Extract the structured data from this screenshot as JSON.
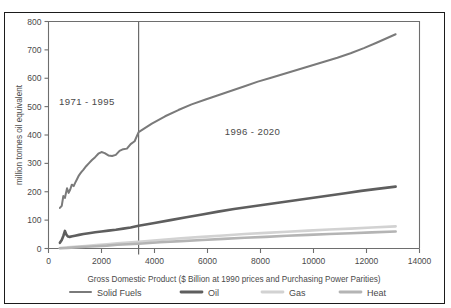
{
  "figure": {
    "cut_off_title": "",
    "background_color": "#ffffff",
    "frame_color": "#1b1b1b"
  },
  "chart_data": {
    "type": "line",
    "title": "",
    "xlabel": "Gross Domestic Product ($ Billion at 1990 prices and Purchasing Power Parities)",
    "ylabel": "million tonnes oil equivalent",
    "xlim": [
      0,
      14000
    ],
    "ylim": [
      0,
      800
    ],
    "xticks": [
      0,
      2000,
      4000,
      6000,
      8000,
      10000,
      12000,
      14000
    ],
    "xtick_labels": [
      "0",
      "2000",
      "4000",
      "6000",
      "8000",
      "10000",
      "12000",
      "14000"
    ],
    "yticks": [
      0,
      100,
      200,
      300,
      400,
      500,
      600,
      700,
      800
    ],
    "ytick_labels": [
      "0",
      "100",
      "200",
      "300",
      "400",
      "500",
      "600",
      "700",
      "800"
    ],
    "grid": false,
    "legend_position": "below-axis",
    "annotations": [
      {
        "text": "1971 - 1995",
        "x": 1450,
        "y": 505
      },
      {
        "text": "1996 - 2020",
        "x": 7700,
        "y": 400
      }
    ],
    "divider": {
      "x": 3400,
      "label": "history / projection split",
      "color": "#6b6b6b"
    },
    "series": [
      {
        "name": "Solid Fuels",
        "color": "#7a7a7a",
        "width": 2.0,
        "x": [
          430,
          500,
          560,
          620,
          660,
          700,
          760,
          820,
          880,
          950,
          1010,
          1080,
          1150,
          1230,
          1320,
          1420,
          1520,
          1640,
          1760,
          1880,
          2000,
          2120,
          2260,
          2400,
          2540,
          2680,
          2820,
          2960,
          3100,
          3250,
          3400,
          3900,
          4400,
          4900,
          5400,
          5900,
          6400,
          6900,
          7400,
          7900,
          8400,
          8900,
          9400,
          9900,
          10400,
          10900,
          11400,
          11900,
          12400,
          13100
        ],
        "y": [
          143,
          150,
          185,
          178,
          196,
          212,
          196,
          208,
          225,
          220,
          232,
          245,
          258,
          268,
          278,
          290,
          300,
          312,
          322,
          334,
          340,
          336,
          328,
          326,
          330,
          344,
          350,
          352,
          368,
          378,
          410,
          440,
          466,
          488,
          508,
          524,
          540,
          556,
          572,
          588,
          602,
          616,
          630,
          644,
          658,
          672,
          688,
          706,
          726,
          755
        ]
      },
      {
        "name": "Oil",
        "color": "#5e5e5e",
        "width": 2.6,
        "x": [
          430,
          500,
          560,
          620,
          680,
          740,
          800,
          900,
          1000,
          1150,
          1320,
          1520,
          1760,
          2000,
          2260,
          2540,
          2820,
          3100,
          3400,
          4000,
          4600,
          5200,
          5800,
          6400,
          7000,
          7600,
          8200,
          8800,
          9400,
          10000,
          10600,
          11200,
          11800,
          12400,
          13100
        ],
        "y": [
          20,
          30,
          44,
          62,
          48,
          42,
          41,
          43,
          45,
          48,
          51,
          54,
          57,
          60,
          63,
          66,
          70,
          74,
          80,
          90,
          100,
          110,
          120,
          130,
          139,
          147,
          155,
          163,
          171,
          179,
          187,
          195,
          203,
          210,
          218
        ]
      },
      {
        "name": "Gas",
        "color": "#d2d2d2",
        "width": 2.6,
        "x": [
          430,
          700,
          1000,
          1400,
          1800,
          2200,
          2600,
          3000,
          3400,
          4200,
          5000,
          5800,
          6600,
          7400,
          8200,
          9000,
          9800,
          10600,
          11400,
          12200,
          13100
        ],
        "y": [
          2,
          4,
          6,
          9,
          12,
          15,
          18,
          21,
          24,
          30,
          36,
          41,
          46,
          51,
          55,
          59,
          63,
          67,
          70,
          74,
          78
        ]
      },
      {
        "name": "Heat",
        "color": "#b4b4b4",
        "width": 2.6,
        "x": [
          430,
          700,
          1000,
          1400,
          1800,
          2200,
          2600,
          3000,
          3400,
          4200,
          5000,
          5800,
          6600,
          7400,
          8200,
          9000,
          9800,
          10600,
          11400,
          12200,
          13100
        ],
        "y": [
          1,
          2,
          4,
          6,
          8,
          10,
          13,
          15,
          17,
          22,
          26,
          30,
          34,
          38,
          41,
          45,
          48,
          51,
          54,
          57,
          60
        ]
      }
    ]
  },
  "legend": {
    "items": [
      {
        "label": "Solid Fuels",
        "color": "#7a7a7a",
        "width": 2.0
      },
      {
        "label": "Oil",
        "color": "#5e5e5e",
        "width": 2.8
      },
      {
        "label": "Gas",
        "color": "#d2d2d2",
        "width": 2.8
      },
      {
        "label": "Heat",
        "color": "#b4b4b4",
        "width": 2.8
      }
    ]
  }
}
